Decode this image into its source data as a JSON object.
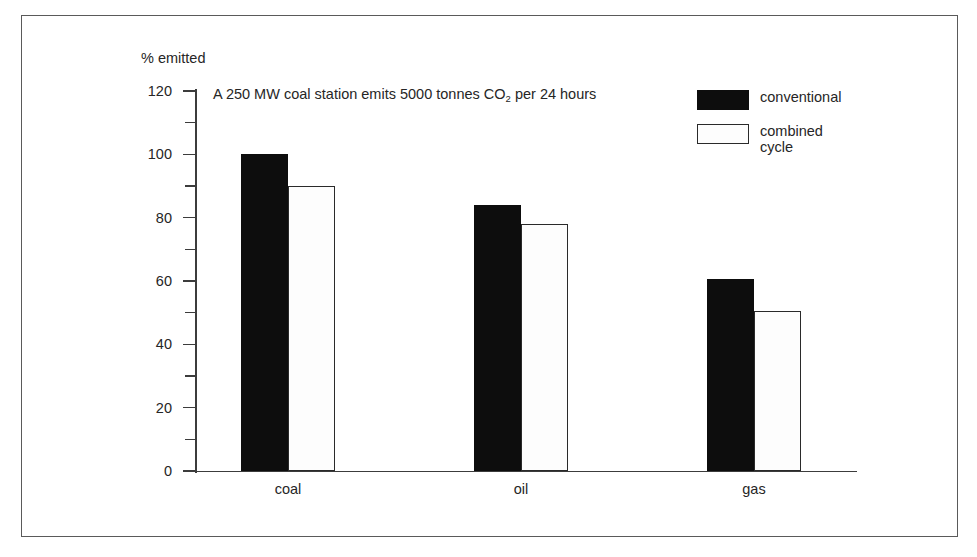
{
  "chart_data": {
    "type": "bar",
    "title": "",
    "annotation": "A 250 MW coal station emits 5000 tonnes CO",
    "annotation_subscript": "2",
    "annotation_tail": " per 24 hours",
    "categories": [
      "coal",
      "oil",
      "gas"
    ],
    "series": [
      {
        "name": "conventional",
        "values": [
          100,
          84,
          60.5
        ],
        "fill": "#0d0d0d"
      },
      {
        "name": "combined cycle",
        "values": [
          90,
          78,
          50.5
        ],
        "fill": "#ffffff"
      }
    ],
    "ylabel": "% emitted",
    "xlabel": "",
    "ylim": [
      0,
      120
    ],
    "ytick_labels": [
      "0",
      "20",
      "40",
      "60",
      "80",
      "100",
      "120"
    ],
    "ytick_values": [
      0,
      20,
      40,
      60,
      80,
      100,
      120
    ],
    "yminor_values": [
      10,
      30,
      50,
      70,
      90,
      110
    ],
    "grid": false,
    "legend_position": "top-right",
    "legend_entries": [
      {
        "label": "conventional"
      },
      {
        "label": "combined\ncycle"
      }
    ]
  },
  "axis": {
    "y_title": "% emitted"
  },
  "colors": {
    "conventional": "#0d0d0d",
    "combined_cycle": "#ffffff",
    "axis": "#3c3c3c",
    "frame": "#5a5a5a",
    "text": "#262626"
  }
}
